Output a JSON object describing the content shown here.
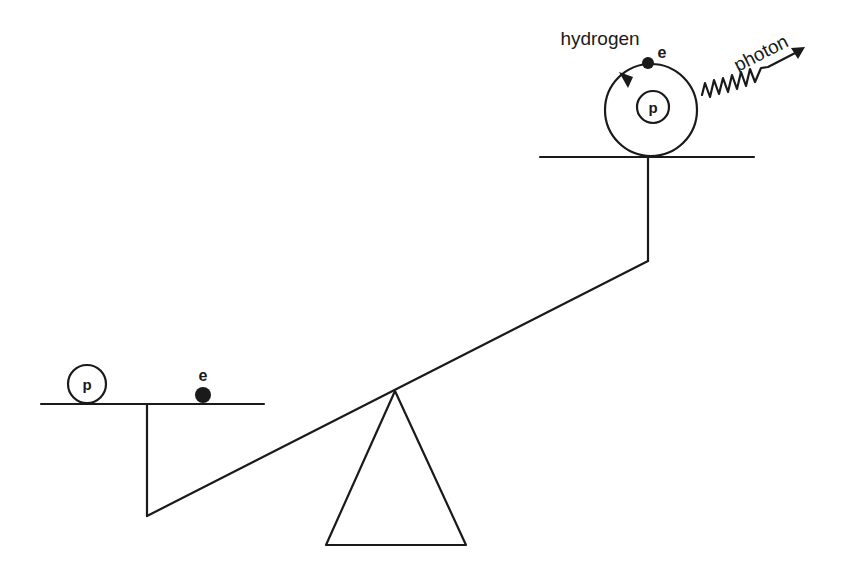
{
  "diagram": {
    "colors": {
      "ink": "#1a1a1a",
      "background": "#ffffff"
    },
    "left_side": {
      "proton_label": "p",
      "electron_label": "e"
    },
    "right_side": {
      "atom_label": "hydrogen",
      "proton_label": "p",
      "electron_label": "e",
      "photon_label": "photon"
    }
  }
}
